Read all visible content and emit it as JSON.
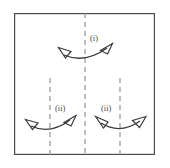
{
  "figure": {
    "name": "paper-folding-diagram",
    "background_color": "#ffffff",
    "line_color": "#4a4a4a",
    "dash_color": "#8a8a8a",
    "border": {
      "name": "outer-square",
      "x": 14,
      "y": 13,
      "width": 141,
      "height": 142,
      "stroke_width": 1.2
    },
    "crease_lines": [
      {
        "name": "center-vertical-crease",
        "x": 85,
        "y1": 13,
        "y2": 155
      },
      {
        "name": "left-vertical-crease",
        "x": 50,
        "y1": 78,
        "y2": 155
      },
      {
        "name": "right-vertical-crease",
        "x": 120,
        "y1": 78,
        "y2": 155
      }
    ],
    "labels": [
      {
        "name": "label-step-i",
        "text": "(i)",
        "x": 90,
        "y": 41
      },
      {
        "name": "label-step-ii-left",
        "text": "(ii)",
        "x": 55,
        "y": 111
      },
      {
        "name": "label-step-ii-right",
        "text": "(ii)",
        "x": 101,
        "y": 111
      }
    ],
    "arrows": [
      {
        "name": "fold-arrow-step-i",
        "label_ref": "(i)",
        "description": "double-headed curved arrow across center crease",
        "curve": "M 64,55 Q 85,64 107,48",
        "head_left": "59,48 71,51 66,58",
        "head_right": "112,44 101,50 108,54"
      },
      {
        "name": "fold-arrow-step-ii-left",
        "label_ref": "(ii)",
        "description": "double-headed curved arrow across left crease",
        "curve": "M 31,126 Q 50,135 70,120",
        "head_left": "26,119 38,122 33,129",
        "head_right": "75,116 64,122 71,126"
      },
      {
        "name": "fold-arrow-step-ii-right",
        "label_ref": "(ii)",
        "description": "double-headed curved arrow across right crease",
        "curve": "M 101,123 Q 120,135 140,121",
        "head_left": "96,117 108,122 104,128",
        "head_right": "145,117 133,121 140,127"
      }
    ]
  }
}
